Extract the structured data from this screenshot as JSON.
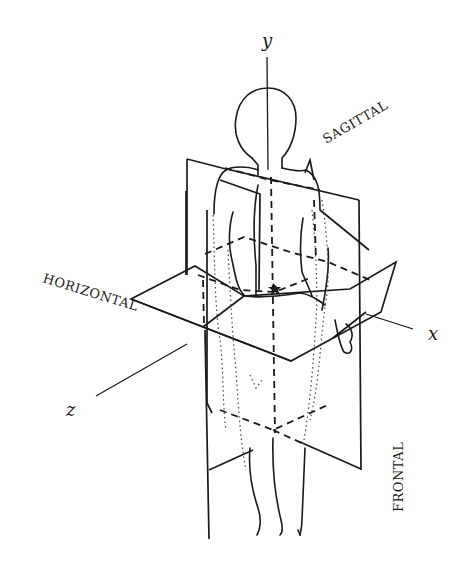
{
  "diagram": {
    "axes": {
      "y": "y",
      "x": "x",
      "z": "z"
    },
    "planes": {
      "sagittal": "SAGITTAL",
      "horizontal": "HORIZONTAL",
      "frontal": "FRONTAL"
    },
    "colors": {
      "ink": "#1a1a1a",
      "background": "#ffffff"
    }
  }
}
